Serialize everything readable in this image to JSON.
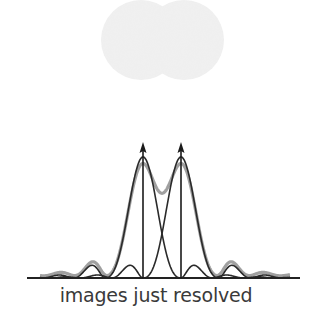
{
  "caption": "images just resolved",
  "colors": {
    "spot": "#f0f0f0",
    "curve": "#2a2a2a",
    "sum_curve": "#9a9a9a",
    "arrow": "#1a1a1a",
    "baseline": "#222222",
    "text": "#3a3a3a"
  },
  "spots": [
    {
      "cx": 141,
      "cy": 40,
      "r": 40
    },
    {
      "cx": 184,
      "cy": 40,
      "r": 40
    }
  ],
  "peaks": [
    {
      "x": 143,
      "label": "left-source"
    },
    {
      "x": 181,
      "label": "right-source"
    }
  ],
  "baseline": {
    "x1": 27,
    "x2": 300,
    "y": 278
  },
  "peak_top_y": 157,
  "arrow_top_y": 143
}
